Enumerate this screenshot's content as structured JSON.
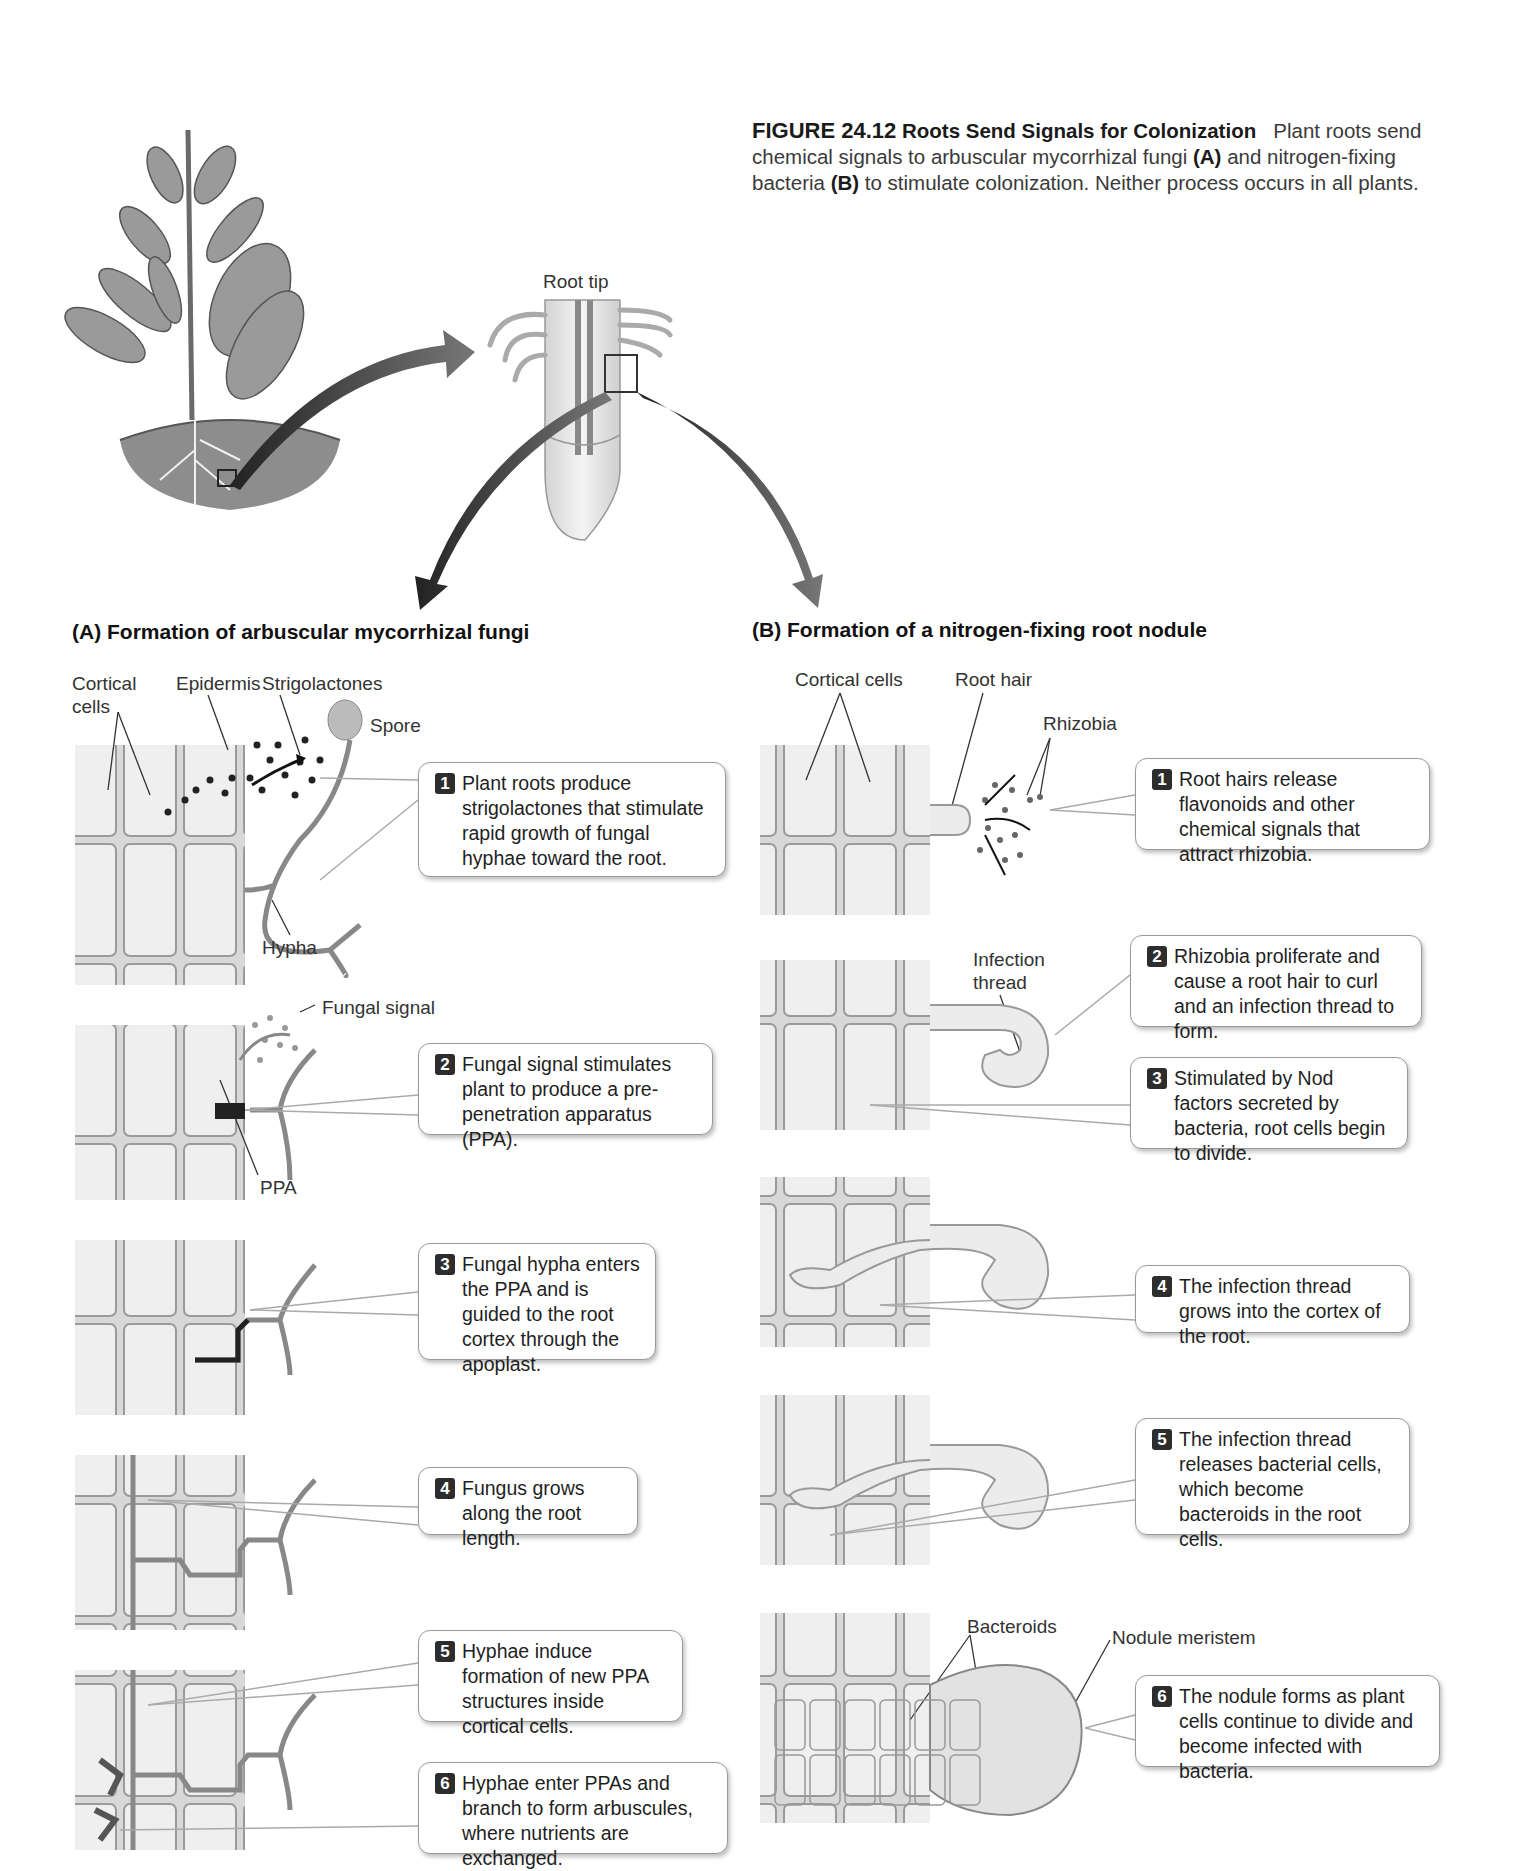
{
  "caption": {
    "figure_number": "FIGURE 24.12",
    "title": "Roots Send Signals for Colonization",
    "text_part1": "Plant roots send chemical signals to arbuscular mycorrhizal fungi",
    "ref_a": "(A)",
    "text_part2": "and nitrogen-fixing bacteria",
    "ref_b": "(B)",
    "text_part3": "to stimulate colonization. Neither process occurs in all plants."
  },
  "overview": {
    "root_tip_label": "Root tip"
  },
  "panel_a": {
    "title": "(A)  Formation of arbuscular mycorrhizal fungi",
    "labels": {
      "cortical_cells_line1": "Cortical",
      "cortical_cells_line2": "cells",
      "epidermis": "Epidermis",
      "strigolactones": "Strigolactones",
      "spore": "Spore",
      "hypha": "Hypha",
      "fungal_signal": "Fungal signal",
      "ppa": "PPA"
    },
    "steps": [
      {
        "num": "1",
        "text": "Plant roots produce strigolactones that stimulate rapid growth of fungal hyphae toward the root."
      },
      {
        "num": "2",
        "text": "Fungal signal stimulates plant to produce a pre-penetration apparatus (PPA)."
      },
      {
        "num": "3",
        "text": "Fungal hypha enters the PPA and is guided to the root cortex through the apoplast."
      },
      {
        "num": "4",
        "text": "Fungus grows along the root length."
      },
      {
        "num": "5",
        "text": "Hyphae induce formation of new PPA structures inside cortical cells."
      },
      {
        "num": "6",
        "text": "Hyphae enter PPAs and branch to form arbuscules, where nutrients are exchanged."
      }
    ]
  },
  "panel_b": {
    "title": "(B)  Formation of a nitrogen-fixing root nodule",
    "labels": {
      "cortical_cells": "Cortical cells",
      "root_hair": "Root hair",
      "rhizobia": "Rhizobia",
      "infection_thread_line1": "Infection",
      "infection_thread_line2": "thread",
      "bacteroids": "Bacteroids",
      "nodule_meristem": "Nodule meristem"
    },
    "steps": [
      {
        "num": "1",
        "text": "Root hairs release flavonoids and other chemical signals that attract rhizobia."
      },
      {
        "num": "2",
        "text": "Rhizobia proliferate and cause a root hair to curl and an infection thread to form."
      },
      {
        "num": "3",
        "text": "Stimulated by Nod factors secreted by bacteria, root cells begin to divide."
      },
      {
        "num": "4",
        "text": "The infection thread grows into the cortex of the root."
      },
      {
        "num": "5",
        "text": "The infection thread releases bacterial cells, which become bacteroids in the root cells."
      },
      {
        "num": "6",
        "text": "The nodule forms as plant cells continue to divide and become infected with bacteria."
      }
    ]
  },
  "colors": {
    "cell_fill": "#ebebeb",
    "cell_wall": "#8a8a8a",
    "hypha": "#7a7a7a",
    "badge": "#2d2d2d",
    "arrow": "#555555"
  }
}
